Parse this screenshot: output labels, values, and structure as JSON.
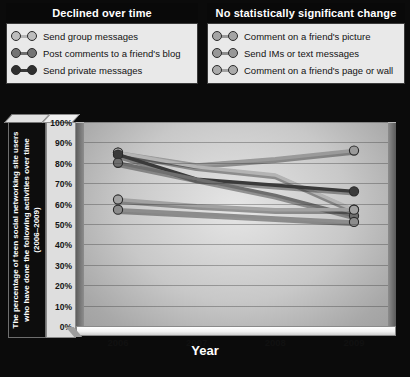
{
  "legends": [
    {
      "id": "declined",
      "title": "Declined over time",
      "items": [
        {
          "label": "Send group messages",
          "color": "#b4b4b4",
          "icon": "line-marker-icon"
        },
        {
          "label": "Post comments to a friend's blog",
          "color": "#6e6e6e",
          "icon": "line-marker-icon"
        },
        {
          "label": "Send private messages",
          "color": "#3a3a3a",
          "icon": "line-marker-icon"
        }
      ]
    },
    {
      "id": "no-change",
      "title": "No statistically significant change",
      "items": [
        {
          "label": "Comment on a friend's picture",
          "color": "#9a9a9a",
          "icon": "line-marker-icon"
        },
        {
          "label": "Send IMs or text messages",
          "color": "#8c8c8c",
          "icon": "line-marker-icon"
        },
        {
          "label": "Comment on a friend's page or wall",
          "color": "#a2a2a2",
          "icon": "line-marker-icon"
        }
      ]
    }
  ],
  "chart_data": {
    "type": "line",
    "title": "",
    "xlabel": "Year",
    "ylabel": "The percentage of teen social networking site users who have done the following activities over time (2006–2009)",
    "categories": [
      "2006",
      "2007",
      "2008",
      "2009"
    ],
    "ylim": [
      0,
      100
    ],
    "ytick_labels": [
      "0%",
      "10%",
      "20%",
      "30%",
      "40%",
      "50%",
      "60%",
      "70%",
      "80%",
      "90%",
      "100%"
    ],
    "ytick_values": [
      0,
      10,
      20,
      30,
      40,
      50,
      60,
      70,
      80,
      90,
      100
    ],
    "grid": true,
    "legend_position": "top",
    "series": [
      {
        "name": "Comment on a friend's picture",
        "group": "No statistically significant change",
        "color": "#9a9a9a",
        "values": [
          85,
          79,
          82,
          86
        ]
      },
      {
        "name": "Send group messages",
        "group": "Declined over time",
        "color": "#b4b4b4",
        "values": [
          85,
          78,
          74,
          57
        ]
      },
      {
        "name": "Send private messages",
        "group": "Declined over time",
        "color": "#3a3a3a",
        "values": [
          84,
          72,
          69,
          66
        ]
      },
      {
        "name": "Post comments to a friend's blog",
        "group": "Declined over time",
        "color": "#6e6e6e",
        "values": [
          80,
          72,
          64,
          54
        ]
      },
      {
        "name": "Comment on a friend's page or wall",
        "group": "No statistically significant change",
        "color": "#a2a2a2",
        "values": [
          62,
          59,
          57,
          57
        ]
      },
      {
        "name": "Send IMs or text messages",
        "group": "No statistically significant change",
        "color": "#8c8c8c",
        "values": [
          57,
          55,
          53,
          51
        ]
      }
    ]
  }
}
